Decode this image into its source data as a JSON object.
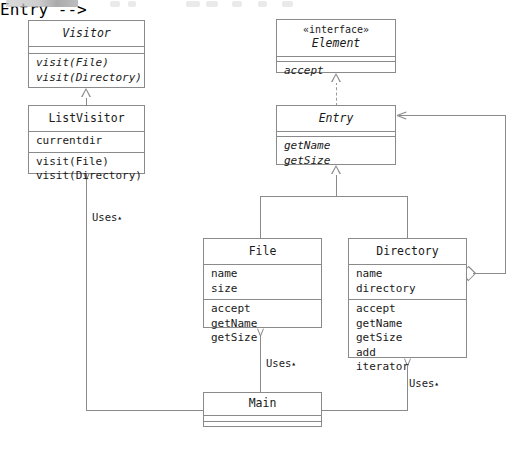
{
  "diagram": {
    "line_color": "#8a8a8a",
    "text_color": "#1a1a1a",
    "background": "#ffffff"
  },
  "classes": {
    "visitor": {
      "name": "Visitor",
      "abstract": true,
      "attributes": [],
      "methods": [
        "visit(File)",
        "visit(Directory)"
      ]
    },
    "list_visitor": {
      "name": "ListVisitor",
      "abstract": false,
      "attributes": [
        "currentdir"
      ],
      "methods": [
        "visit(File)",
        "visit(Directory)"
      ]
    },
    "element": {
      "stereotype": "« interface »",
      "stereotype_display": "«interface»",
      "name": "Element",
      "abstract": true,
      "attributes": [],
      "methods": [
        "accept"
      ]
    },
    "entry": {
      "name": "Entry",
      "abstract": true,
      "attributes": [],
      "methods": [
        "getName",
        "getSize"
      ]
    },
    "file": {
      "name": "File",
      "abstract": false,
      "attributes": [
        "name",
        "size"
      ],
      "methods": [
        "accept",
        "getName",
        "getSize"
      ]
    },
    "directory": {
      "name": "Directory",
      "abstract": false,
      "attributes": [
        "name",
        "directory"
      ],
      "methods": [
        "accept",
        "getName",
        "getSize",
        "add",
        "iterator"
      ]
    },
    "main": {
      "name": "Main",
      "abstract": false,
      "attributes": [],
      "methods": []
    }
  },
  "relations": {
    "uses_label": "Uses",
    "uses_marker": "▴",
    "list": [
      {
        "kind": "generalization",
        "from": "ListVisitor",
        "to": "Visitor"
      },
      {
        "kind": "realization",
        "from": "Entry",
        "to": "Element"
      },
      {
        "kind": "generalization",
        "from": "File",
        "to": "Entry"
      },
      {
        "kind": "generalization",
        "from": "Directory",
        "to": "Entry"
      },
      {
        "kind": "aggregation",
        "from": "Directory",
        "to": "Entry"
      },
      {
        "kind": "dependency",
        "from": "Main",
        "to": "ListVisitor",
        "label": "Uses"
      },
      {
        "kind": "dependency",
        "from": "Main",
        "to": "File",
        "label": "Uses"
      },
      {
        "kind": "dependency",
        "from": "Main",
        "to": "Directory",
        "label": "Uses"
      }
    ]
  }
}
